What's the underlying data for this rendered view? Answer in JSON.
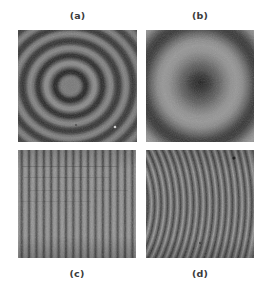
{
  "figure": {
    "background_color": "#ffffff",
    "width": 268,
    "height": 290,
    "label_color": "#3a3a3a",
    "panels": [
      {
        "id": "a",
        "label": "(a)",
        "label_position": "top",
        "caption_text": "(a)",
        "pattern": "concentric-circular-fringes",
        "description": "dense concentric circular interference fringes with light central disk",
        "ring_count": 8,
        "center_tone": "#7a7a7a",
        "dark_fringe_color": "#2f2f2f",
        "light_fringe_color": "#8e8e8e",
        "base_tone": "#6b6b6b",
        "center_x_pct": 44,
        "center_y_pct": 50
      },
      {
        "id": "b",
        "label": "(b)",
        "label_position": "top",
        "caption_text": "(b)",
        "pattern": "concentric-circular-fringes",
        "description": "few wide concentric rings with dark mottled center",
        "ring_count": 3,
        "center_tone": "#3a3a3a",
        "dark_fringe_color": "#333333",
        "light_fringe_color": "#9a9a9a",
        "base_tone": "#7d7d7d",
        "center_x_pct": 50,
        "center_y_pct": 48
      },
      {
        "id": "c",
        "label": "(c)",
        "label_position": "bottom",
        "caption_text": "(c)",
        "pattern": "straight-vertical-fringes",
        "description": "straight equally spaced vertical interference fringes",
        "fringe_count": 16,
        "dark_fringe_color": "#3c3c3c",
        "light_fringe_color": "#9a9a9a",
        "base_tone": "#6e6e6e"
      },
      {
        "id": "d",
        "label": "(d)",
        "label_position": "bottom",
        "caption_text": "(d)",
        "pattern": "curved-vertical-fringes",
        "description": "curved arc-shaped vertical interference fringes bowing to the left",
        "fringe_count": 15,
        "dark_fringe_color": "#3c3c3c",
        "light_fringe_color": "#9a9a9a",
        "base_tone": "#737373"
      }
    ]
  }
}
